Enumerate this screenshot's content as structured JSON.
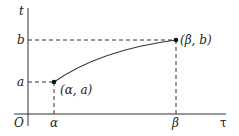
{
  "diagram": {
    "axes": {
      "vertical_label": "t",
      "horizontal_label": "τ",
      "origin_label": "O"
    },
    "ticks": {
      "t_ticks": [
        "b",
        "a"
      ],
      "tau_ticks": [
        "α",
        "β"
      ]
    },
    "points": [
      {
        "label": "(α, a)",
        "x_tick": "α",
        "y_tick": "a"
      },
      {
        "label": "(β, b)",
        "x_tick": "β",
        "y_tick": "b"
      }
    ],
    "curve": "concave increasing curve from (α, a) to (β, b)",
    "colors": {
      "ink": "#222222",
      "background": "#ffffff"
    }
  }
}
